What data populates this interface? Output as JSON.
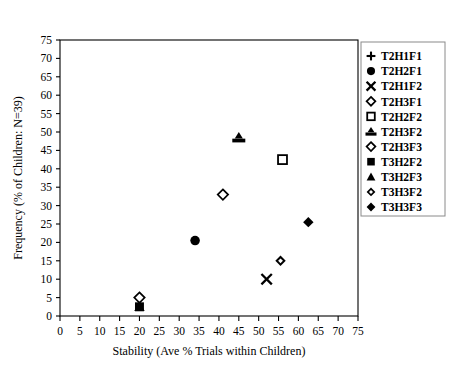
{
  "chart_data": {
    "type": "scatter",
    "title": "",
    "xlabel": "Stability (Ave % Trials within Children)",
    "ylabel": "Frequency (% of Children: N=39)",
    "xlim": [
      0,
      75
    ],
    "ylim": [
      0,
      75
    ],
    "xticks": [
      0,
      5,
      10,
      15,
      20,
      25,
      30,
      35,
      40,
      45,
      50,
      55,
      60,
      65,
      70,
      75
    ],
    "yticks": [
      0,
      5,
      10,
      15,
      20,
      25,
      30,
      35,
      40,
      45,
      50,
      55,
      60,
      65,
      70,
      75
    ],
    "grid": false,
    "legend_position": "right",
    "series": [
      {
        "name": "T2H1F1",
        "marker": "plus",
        "x": null,
        "y": null
      },
      {
        "name": "T2H2F1",
        "marker": "filled-circle",
        "x": 34.0,
        "y": 20.5
      },
      {
        "name": "T2H1F2",
        "marker": "cross",
        "x": 52.0,
        "y": 10.0
      },
      {
        "name": "T2H3F1",
        "marker": "open-diamond",
        "x": 41.0,
        "y": 33.0
      },
      {
        "name": "T2H2F2",
        "marker": "open-square",
        "x": 56.0,
        "y": 42.5
      },
      {
        "name": "T2H3F2",
        "marker": "triangle-bar",
        "x": 45.0,
        "y": 48.5
      },
      {
        "name": "T2H3F3",
        "marker": "open-diamond",
        "x": 20.0,
        "y": 5.0
      },
      {
        "name": "T3H2F2",
        "marker": "filled-square",
        "x": 20.0,
        "y": 2.5
      },
      {
        "name": "T3H2F3",
        "marker": "filled-triangle",
        "x": 20.0,
        "y": 2.5
      },
      {
        "name": "T3H3F2",
        "marker": "diamond-in-diamond",
        "x": 55.5,
        "y": 15.0
      },
      {
        "name": "T3H3F3",
        "marker": "filled-diamond",
        "x": 62.5,
        "y": 25.5
      }
    ]
  },
  "legend": {
    "items": [
      {
        "label": "T2H1F1",
        "marker": "plus"
      },
      {
        "label": "T2H2F1",
        "marker": "filled-circle"
      },
      {
        "label": "T2H1F2",
        "marker": "cross"
      },
      {
        "label": "T2H3F1",
        "marker": "open-diamond"
      },
      {
        "label": "T2H2F2",
        "marker": "open-square"
      },
      {
        "label": "T2H3F2",
        "marker": "triangle-bar"
      },
      {
        "label": "T2H3F3",
        "marker": "open-diamond"
      },
      {
        "label": "T3H2F2",
        "marker": "filled-square"
      },
      {
        "label": "T3H2F3",
        "marker": "filled-triangle"
      },
      {
        "label": "T3H3F2",
        "marker": "diamond-in-diamond"
      },
      {
        "label": "T3H3F3",
        "marker": "filled-diamond"
      }
    ]
  },
  "colors": {
    "ink": "#000000",
    "background": "#ffffff",
    "legend_border": "#8a8a8a"
  }
}
